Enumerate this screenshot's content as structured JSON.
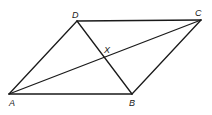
{
  "figure": {
    "type": "parallelogram-with-diagonals",
    "vertices": {
      "A": {
        "label": "A",
        "x": 9,
        "y": 94
      },
      "B": {
        "label": "B",
        "x": 132,
        "y": 94
      },
      "C": {
        "label": "C",
        "x": 201,
        "y": 20
      },
      "D": {
        "label": "D",
        "x": 77,
        "y": 21
      }
    },
    "intersection": {
      "label": "X",
      "x": 104,
      "y": 57
    },
    "sides": [
      {
        "name": "AB",
        "from": "A",
        "to": "B"
      },
      {
        "name": "BC",
        "from": "B",
        "to": "C"
      },
      {
        "name": "CD",
        "from": "C",
        "to": "D"
      },
      {
        "name": "DA",
        "from": "D",
        "to": "A"
      }
    ],
    "diagonals": [
      {
        "name": "AC",
        "from": "A",
        "to": "C"
      },
      {
        "name": "BD",
        "from": "B",
        "to": "D"
      }
    ],
    "colors": {
      "line": "#1a1a1a",
      "background": "#ffffff"
    }
  }
}
